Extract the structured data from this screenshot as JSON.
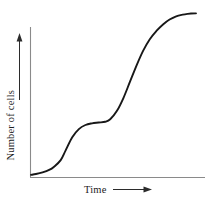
{
  "figure": {
    "background_color": "#ffffff",
    "width": 213,
    "height": 203
  },
  "axes": {
    "color": "#8a8a8a",
    "x_axis_name": "time-axis",
    "y_axis_name": "number-of-cells-axis"
  },
  "labels": {
    "x_label": "Time",
    "y_label": "Number of cells",
    "x_arrow_icon": "arrow-right-icon",
    "y_arrow_icon": "arrow-up-icon"
  },
  "chart_data": {
    "type": "line",
    "title": "",
    "xlabel": "Time",
    "ylabel": "Number of cells",
    "grid": false,
    "legend": null,
    "axis_ticks": {
      "x": [],
      "y": []
    },
    "xlim": [
      0,
      100
    ],
    "ylim": [
      0,
      100
    ],
    "curve_color": "#181818",
    "series": [
      {
        "name": "cell growth",
        "x": [
          0,
          3,
          7,
          11,
          14,
          18,
          21,
          25,
          29,
          33,
          37,
          41,
          45,
          48,
          52,
          56,
          60,
          64,
          68,
          72,
          76,
          80,
          84,
          88,
          92,
          95,
          97,
          100
        ],
        "y": [
          1,
          1.5,
          2.5,
          4,
          6,
          10,
          16,
          24,
          29,
          31.5,
          32.5,
          33,
          33.5,
          35,
          40,
          48,
          58,
          68,
          77,
          84,
          89,
          93,
          96,
          98,
          99,
          99.5,
          99.7,
          99.8
        ]
      }
    ]
  }
}
